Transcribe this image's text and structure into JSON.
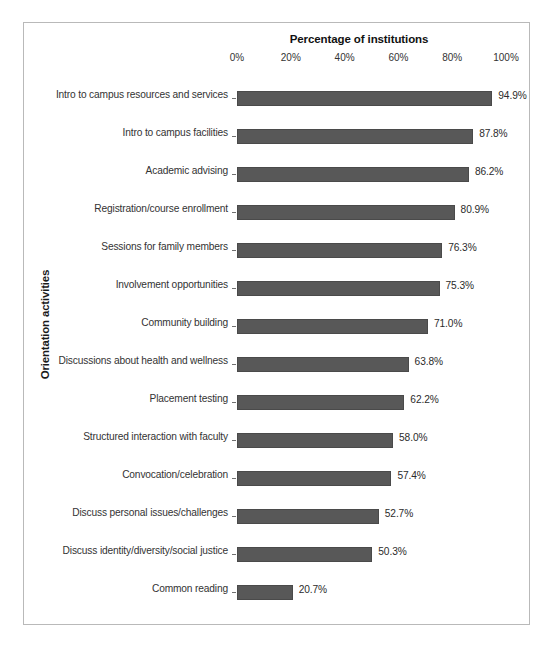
{
  "chart_data": {
    "type": "bar",
    "orientation": "horizontal",
    "title": "Percentage of institutions",
    "xlabel": "Percentage of institutions",
    "ylabel": "Orientation activities",
    "xlim": [
      0,
      100
    ],
    "xticks": [
      "0%",
      "20%",
      "40%",
      "60%",
      "80%",
      "100%"
    ],
    "xtick_values": [
      0,
      20,
      40,
      60,
      80,
      100
    ],
    "grid": false,
    "legend": "none",
    "bar_color": "#585858",
    "categories": [
      "Intro to campus resources and services",
      "Intro to campus facilities",
      "Academic advising",
      "Registration/course enrollment",
      "Sessions for family members",
      "Involvement opportunities",
      "Community building",
      "Discussions about health and wellness",
      "Placement testing",
      "Structured interaction with faculty",
      "Convocation/celebration",
      "Discuss personal issues/challenges",
      "Discuss identity/diversity/social justice",
      "Common reading"
    ],
    "values": [
      94.9,
      87.8,
      86.2,
      80.9,
      76.3,
      75.3,
      71.0,
      63.8,
      62.2,
      58.0,
      57.4,
      52.7,
      50.3,
      20.7
    ],
    "value_labels": [
      "94.9%",
      "87.8%",
      "86.2%",
      "80.9%",
      "76.3%",
      "75.3%",
      "71.0%",
      "63.8%",
      "62.2%",
      "58.0%",
      "57.4%",
      "52.7%",
      "50.3%",
      "20.7%"
    ]
  }
}
